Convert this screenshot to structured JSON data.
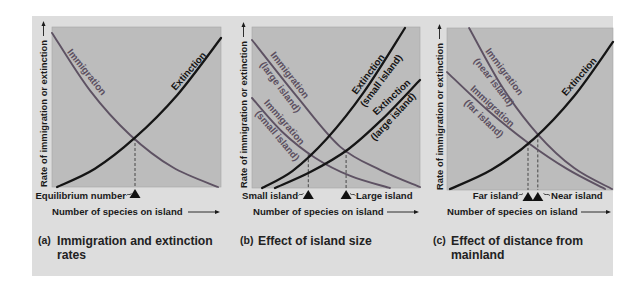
{
  "colors": {
    "page": "#ffffff",
    "card": "#dddddd",
    "plot": "#bcbcbc",
    "immigration": "#5e5263",
    "extinction": "#151515"
  },
  "panels": [
    {
      "letter": "(a)",
      "caption": [
        "Immigration and extinction",
        "rates"
      ],
      "y_axis_label": "Rate of immigration or extinction",
      "x_axis_label": "Number of species on island",
      "curve_labels": {
        "immigration": [
          "Immigration"
        ],
        "extinction": [
          "Extinction"
        ]
      },
      "markers": [
        "Equilibrium number"
      ]
    },
    {
      "letter": "(b)",
      "caption": [
        "Effect of island size"
      ],
      "y_axis_label": "Rate of immigration or extinction",
      "x_axis_label": "Number of species on island",
      "curve_labels": {
        "immigration_large": [
          "Immigration",
          "(large island)"
        ],
        "immigration_small": [
          "Immigration",
          "(small island)"
        ],
        "extinction_small": [
          "Extinction",
          "(small island)"
        ],
        "extinction_large": [
          "Extinction",
          "(large island)"
        ]
      },
      "markers": [
        "Small island",
        "Large island"
      ]
    },
    {
      "letter": "(c)",
      "caption": [
        "Effect of distance from",
        "mainland"
      ],
      "y_axis_label": "Rate of immigration or extinction",
      "x_axis_label": "Number of species on island",
      "curve_labels": {
        "immigration_near": [
          "Immigration",
          "(near island)"
        ],
        "immigration_far": [
          "Immigration",
          "(far island)"
        ],
        "extinction": [
          "Extinction"
        ]
      },
      "markers": [
        "Far island",
        "Near island"
      ]
    }
  ],
  "chart_data": [
    {
      "type": "line",
      "title": "(a) Immigration and extinction rates",
      "xlabel": "Number of species on island",
      "ylabel": "Rate of immigration or extinction",
      "xlim": [
        0,
        1
      ],
      "ylim": [
        0,
        1
      ],
      "grid": false,
      "legend": "inline curve labels",
      "series": [
        {
          "name": "Immigration",
          "color": "#5e5263",
          "x": [
            0,
            0.224,
            0.462,
            0.714,
            0.982
          ],
          "y": [
            0.963,
            0.604,
            0.325,
            0.123,
            0.0
          ]
        },
        {
          "name": "Extinction",
          "color": "#151515",
          "x": [
            0.03,
            0.254,
            0.491,
            0.74,
            1.0
          ],
          "y": [
            0.0,
            0.114,
            0.308,
            0.574,
            0.931
          ]
        }
      ],
      "equilibria": [
        {
          "label": "Equilibrium number",
          "x": 0.491,
          "y": 0.306
        }
      ]
    },
    {
      "type": "line",
      "title": "(b) Effect of island size",
      "xlabel": "Number of species on island",
      "ylabel": "Rate of immigration or extinction",
      "xlim": [
        0,
        1
      ],
      "ylim": [
        0,
        1
      ],
      "grid": false,
      "legend": "inline curve labels",
      "series": [
        {
          "name": "Immigration (large island)",
          "color": "#5e5263",
          "x": [
            0,
            0.268,
            0.524,
            0.768,
            1.0
          ],
          "y": [
            0.919,
            0.567,
            0.257,
            0.11,
            0.006
          ]
        },
        {
          "name": "Immigration (small island)",
          "color": "#5e5263",
          "x": [
            0,
            0.179,
            0.375,
            0.589,
            0.821
          ],
          "y": [
            0.559,
            0.35,
            0.188,
            0.073,
            0.0
          ]
        },
        {
          "name": "Extinction (small island)",
          "color": "#151515",
          "x": [
            0.06,
            0.242,
            0.445,
            0.668,
            0.911
          ],
          "y": [
            0.0,
            0.107,
            0.306,
            0.599,
            0.994
          ]
        },
        {
          "name": "Extinction (large island)",
          "color": "#151515",
          "x": [
            0.137,
            0.347,
            0.573,
            0.779,
            1.0
          ],
          "y": [
            0.0,
            0.099,
            0.241,
            0.431,
            0.671
          ]
        }
      ],
      "equilibria": [
        {
          "label": "Small island",
          "x": 0.335,
          "y": 0.21
        },
        {
          "label": "Large island",
          "x": 0.56,
          "y": 0.236
        }
      ]
    },
    {
      "type": "line",
      "title": "(c) Effect of distance from mainland",
      "xlabel": "Number of species on island",
      "ylabel": "Rate of immigration or extinction",
      "xlim": [
        0,
        1
      ],
      "ylim": [
        0,
        1
      ],
      "grid": false,
      "legend": "inline curve labels",
      "series": [
        {
          "name": "Immigration (near island)",
          "color": "#5e5263",
          "x": [
            0.133,
            0.335,
            0.547,
            0.766,
            0.994
          ],
          "y": [
            1.0,
            0.632,
            0.344,
            0.135,
            0.006
          ]
        },
        {
          "name": "Immigration (far island)",
          "color": "#5e5263",
          "x": [
            0,
            0.247,
            0.488,
            0.723,
            0.952
          ],
          "y": [
            0.728,
            0.491,
            0.292,
            0.13,
            0.006
          ]
        },
        {
          "name": "Extinction",
          "color": "#151515",
          "x": [
            0.018,
            0.268,
            0.523,
            0.765,
            1.0
          ],
          "y": [
            0.006,
            0.125,
            0.316,
            0.579,
            0.914
          ]
        }
      ],
      "equilibria": [
        {
          "label": "Far island",
          "x": 0.488,
          "y": 0.291
        },
        {
          "label": "Near island",
          "x": 0.547,
          "y": 0.343
        }
      ]
    }
  ]
}
